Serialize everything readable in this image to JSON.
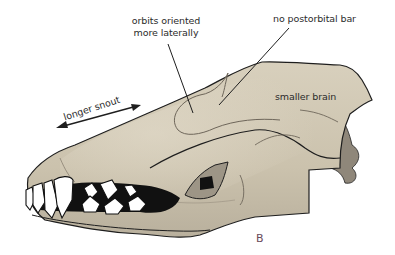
{
  "diagram": {
    "panel_label": "B",
    "labels": {
      "orbits_line1": "orbits oriented",
      "orbits_line2": "more laterally",
      "postorbital": "no postorbital bar",
      "brain": "smaller brain",
      "snout": "longer snout"
    },
    "colors": {
      "bone": "#cfc6b2",
      "bone_shadow": "#a8a091",
      "bone_dark": "#8f877a",
      "outline": "#1e1e1e",
      "teeth": "#ffffff",
      "gaps": "#111111",
      "text": "#2b2b2b",
      "panel_label": "#6a4a5a"
    }
  }
}
